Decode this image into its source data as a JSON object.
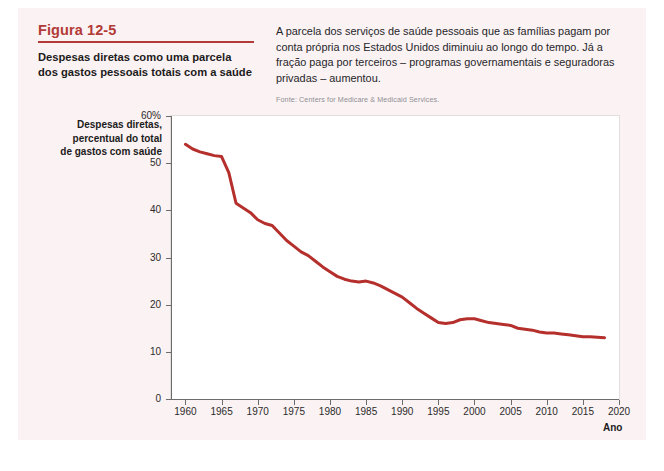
{
  "figure": {
    "number": "Figura 12-5",
    "subtitle": "Despesas diretas como uma parcela dos gastos pessoais totais com a saúde",
    "description": "A parcela dos serviços de saúde pessoais que as famílias pagam por conta própria nos Estados Unidos diminuiu ao longo do tempo. Já a fração paga por terceiros – programas governamentais e seguradoras privadas – aumentou.",
    "source": "Fonte: Centers for Medicare & Medicaid Services.",
    "accent_color": "#b23a37",
    "panel_color": "#fbf2f3"
  },
  "chart_data": {
    "type": "line",
    "title": "Despesas diretas como uma parcela dos gastos pessoais totais com a saúde",
    "xlabel": "Ano",
    "ylabel": "Despesas diretas, percentual do total de gastos com saúde",
    "ylabel_lines": [
      "Despesas diretas,",
      "percentual do total",
      "de gastos com saúde"
    ],
    "xlim": [
      1958,
      2020
    ],
    "ylim": [
      0,
      60
    ],
    "grid": false,
    "legend": "none",
    "line_color": "#b5302c",
    "y_ticks": [
      0,
      10,
      20,
      30,
      40,
      50,
      60
    ],
    "y_tick_labels": [
      "0",
      "10",
      "20",
      "30",
      "40",
      "50",
      "60%"
    ],
    "x_ticks": [
      1960,
      1965,
      1970,
      1975,
      1980,
      1985,
      1990,
      1995,
      2000,
      2005,
      2010,
      2015,
      2020
    ],
    "x_tick_labels": [
      "1960",
      "1965",
      "1970",
      "1975",
      "1980",
      "1985",
      "1990",
      "1995",
      "2000",
      "2005",
      "2010",
      "2015",
      "2020"
    ],
    "series": [
      {
        "name": "Despesas diretas (% do total)",
        "x": [
          1960,
          1961,
          1962,
          1963,
          1964,
          1965,
          1966,
          1967,
          1968,
          1969,
          1970,
          1971,
          1972,
          1973,
          1974,
          1975,
          1976,
          1977,
          1978,
          1979,
          1980,
          1981,
          1982,
          1983,
          1984,
          1985,
          1986,
          1987,
          1988,
          1989,
          1990,
          1991,
          1992,
          1993,
          1994,
          1995,
          1996,
          1997,
          1998,
          1999,
          2000,
          2001,
          2002,
          2003,
          2004,
          2005,
          2006,
          2007,
          2008,
          2009,
          2010,
          2011,
          2012,
          2013,
          2014,
          2015,
          2016,
          2017,
          2018
        ],
        "values": [
          54.0,
          53.0,
          52.4,
          52.0,
          51.6,
          51.4,
          48.0,
          41.5,
          40.5,
          39.5,
          38.0,
          37.2,
          36.8,
          35.2,
          33.6,
          32.4,
          31.2,
          30.4,
          29.2,
          28.0,
          27.0,
          26.0,
          25.4,
          25.0,
          24.8,
          25.0,
          24.6,
          24.0,
          23.2,
          22.4,
          21.6,
          20.4,
          19.2,
          18.2,
          17.2,
          16.2,
          16.0,
          16.2,
          16.8,
          17.0,
          17.0,
          16.6,
          16.2,
          16.0,
          15.8,
          15.6,
          15.0,
          14.8,
          14.6,
          14.2,
          14.0,
          14.0,
          13.8,
          13.6,
          13.4,
          13.2,
          13.2,
          13.1,
          13.0
        ]
      }
    ]
  }
}
